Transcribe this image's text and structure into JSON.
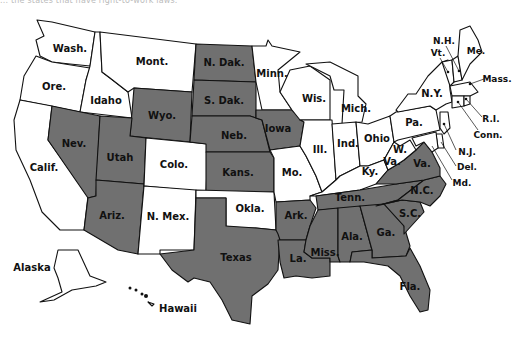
{
  "caption": "... the states that have right-to-work laws.",
  "legend": {
    "shaded_meaning": "Right-to-work state",
    "unshaded_meaning": "Not right-to-work state",
    "shaded_color": "#707070",
    "unshaded_color": "#ffffff"
  },
  "states": {
    "wash": {
      "label": "Wash.",
      "shaded": false
    },
    "ore": {
      "label": "Ore.",
      "shaded": false
    },
    "calif": {
      "label": "Calif.",
      "shaded": false
    },
    "idaho": {
      "label": "Idaho",
      "shaded": false
    },
    "nev": {
      "label": "Nev.",
      "shaded": true
    },
    "mont": {
      "label": "Mont.",
      "shaded": false
    },
    "wyo": {
      "label": "Wyo.",
      "shaded": true
    },
    "utah": {
      "label": "Utah",
      "shaded": true
    },
    "ariz": {
      "label": "Ariz.",
      "shaded": true
    },
    "colo": {
      "label": "Colo.",
      "shaded": false
    },
    "nmex": {
      "label": "N. Mex.",
      "shaded": false
    },
    "ndak": {
      "label": "N. Dak.",
      "shaded": true
    },
    "sdak": {
      "label": "S. Dak.",
      "shaded": true
    },
    "neb": {
      "label": "Neb.",
      "shaded": true
    },
    "kans": {
      "label": "Kans.",
      "shaded": true
    },
    "okla": {
      "label": "Okla.",
      "shaded": false
    },
    "texas": {
      "label": "Texas",
      "shaded": true
    },
    "minn": {
      "label": "Minn.",
      "shaded": false
    },
    "iowa": {
      "label": "Iowa",
      "shaded": true
    },
    "mo": {
      "label": "Mo.",
      "shaded": false
    },
    "ark": {
      "label": "Ark.",
      "shaded": true
    },
    "la": {
      "label": "La.",
      "shaded": true
    },
    "wis": {
      "label": "Wis.",
      "shaded": false
    },
    "ill": {
      "label": "Ill.",
      "shaded": false
    },
    "mich": {
      "label": "Mich.",
      "shaded": false
    },
    "ind": {
      "label": "Ind.",
      "shaded": false
    },
    "ohio": {
      "label": "Ohio",
      "shaded": false
    },
    "ky": {
      "label": "Ky.",
      "shaded": false
    },
    "tenn": {
      "label": "Tenn.",
      "shaded": true
    },
    "miss": {
      "label": "Miss.",
      "shaded": true
    },
    "ala": {
      "label": "Ala.",
      "shaded": true
    },
    "ga": {
      "label": "Ga.",
      "shaded": true
    },
    "fla": {
      "label": "Fla.",
      "shaded": true
    },
    "sc": {
      "label": "S.C.",
      "shaded": true
    },
    "nc": {
      "label": "N.C.",
      "shaded": true
    },
    "va": {
      "label": "Va.",
      "shaded": true
    },
    "wva_1": {
      "label": "W.",
      "shaded": false
    },
    "wva_2": {
      "label": "Va.",
      "shaded": false
    },
    "pa": {
      "label": "Pa.",
      "shaded": false
    },
    "ny": {
      "label": "N.Y.",
      "shaded": false
    },
    "vt": {
      "label": "Vt.",
      "shaded": false
    },
    "nh": {
      "label": "N.H.",
      "shaded": false
    },
    "me": {
      "label": "Me.",
      "shaded": false
    },
    "mass": {
      "label": "Mass.",
      "shaded": false
    },
    "ri": {
      "label": "R.I.",
      "shaded": false
    },
    "conn": {
      "label": "Conn.",
      "shaded": false
    },
    "nj": {
      "label": "N.J.",
      "shaded": false
    },
    "del": {
      "label": "Del.",
      "shaded": false
    },
    "md": {
      "label": "Md.",
      "shaded": false
    },
    "alaska": {
      "label": "Alaska",
      "shaded": false
    },
    "hawaii": {
      "label": "Hawaii",
      "shaded": false
    }
  }
}
